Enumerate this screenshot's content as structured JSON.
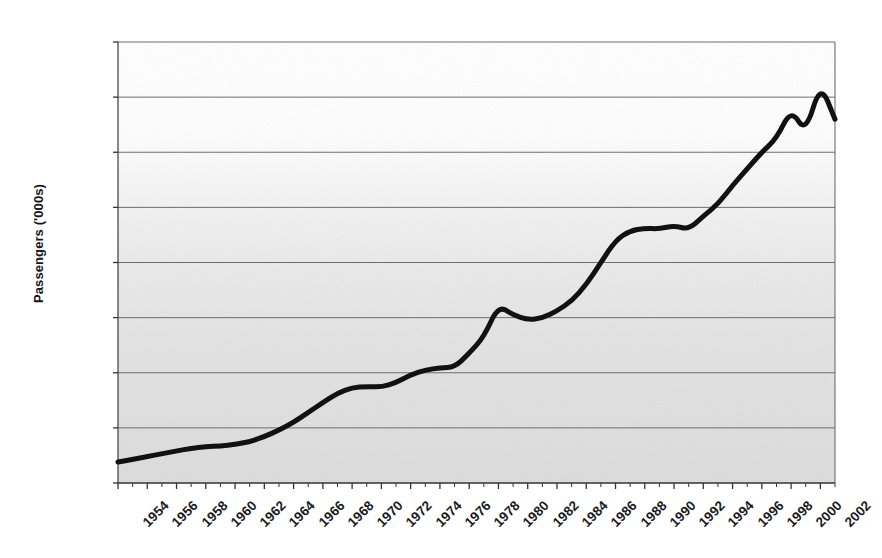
{
  "chart_data": {
    "type": "line",
    "title": "",
    "subtitle": "",
    "xlabel": "",
    "ylabel": "Passengers ('000s)",
    "ylim": [
      0,
      800000
    ],
    "xlim": [
      1954,
      2003
    ],
    "grid": true,
    "legend": false,
    "y_ticks": [
      0,
      100000,
      200000,
      300000,
      400000,
      500000,
      600000,
      700000,
      800000
    ],
    "y_tick_labels": [
      "0",
      "100000",
      "200000",
      "300000",
      "400000",
      "500000",
      "600000",
      "700000",
      "800000"
    ],
    "x_tick_labels": [
      "1954",
      "1956",
      "1958",
      "1960",
      "1962",
      "1964",
      "1966",
      "1968",
      "1970",
      "1972",
      "1974",
      "1976",
      "1978",
      "1980",
      "1982",
      "1984",
      "1986",
      "1988",
      "1990",
      "1992",
      "1994",
      "1996",
      "1998",
      "2000",
      "2002"
    ],
    "x_minor_tick_interval": 1,
    "x_major_tick_interval": 2,
    "series": [
      {
        "name": "Passengers",
        "color": "#111111",
        "line_width": 5,
        "x": [
          1954,
          1955,
          1956,
          1957,
          1958,
          1959,
          1960,
          1961,
          1962,
          1963,
          1964,
          1965,
          1966,
          1967,
          1968,
          1969,
          1970,
          1971,
          1972,
          1973,
          1974,
          1975,
          1976,
          1977,
          1978,
          1979,
          1980,
          1981,
          1982,
          1983,
          1984,
          1985,
          1986,
          1987,
          1988,
          1989,
          1990,
          1991,
          1992,
          1993,
          1994,
          1995,
          1996,
          1997,
          1998,
          1999,
          2000,
          2001,
          2002,
          2003
        ],
        "values": [
          38000,
          43000,
          48000,
          53000,
          58000,
          63000,
          66000,
          67000,
          70000,
          75000,
          84000,
          96000,
          110000,
          128000,
          146000,
          163000,
          173000,
          175000,
          174000,
          182000,
          196000,
          205000,
          209000,
          210000,
          235000,
          265000,
          322000,
          305000,
          296000,
          299000,
          312000,
          330000,
          360000,
          400000,
          440000,
          458000,
          462000,
          461000,
          467000,
          460000,
          484000,
          506000,
          540000,
          570000,
          600000,
          625000,
          678000,
          635000,
          725000,
          660000
        ]
      }
    ]
  },
  "axes": {
    "plot_left_px": 118,
    "plot_right_px": 835,
    "plot_top_px": 42,
    "plot_bottom_px": 483
  }
}
